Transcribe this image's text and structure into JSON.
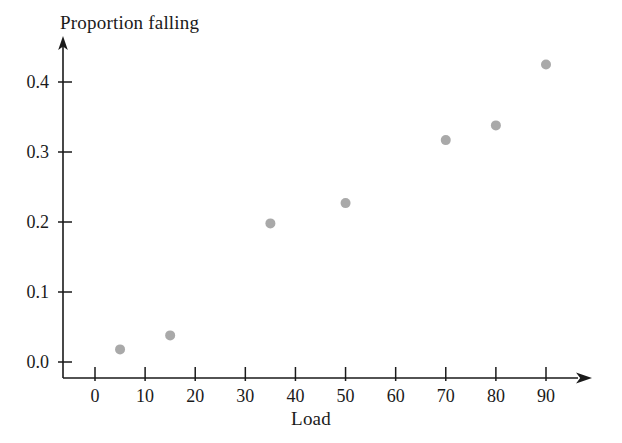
{
  "chart_data": {
    "type": "scatter",
    "title": "",
    "xlabel": "Load",
    "ylabel": "Proportion falling",
    "xlim": [
      0,
      95
    ],
    "ylim": [
      0.0,
      0.44
    ],
    "grid": false,
    "legend": "none",
    "x_ticks": [
      {
        "value": 0,
        "label": "0"
      },
      {
        "value": 10,
        "label": "10"
      },
      {
        "value": 20,
        "label": "20"
      },
      {
        "value": 30,
        "label": "30"
      },
      {
        "value": 40,
        "label": "40"
      },
      {
        "value": 50,
        "label": "50"
      },
      {
        "value": 60,
        "label": "60"
      },
      {
        "value": 70,
        "label": "70"
      },
      {
        "value": 80,
        "label": "80"
      },
      {
        "value": 90,
        "label": "90"
      }
    ],
    "y_ticks": [
      {
        "value": 0.0,
        "label": "0.0"
      },
      {
        "value": 0.1,
        "label": "0.1"
      },
      {
        "value": 0.2,
        "label": "0.2"
      },
      {
        "value": 0.3,
        "label": "0.3"
      },
      {
        "value": 0.4,
        "label": "0.4"
      }
    ],
    "x": [
      5,
      15,
      35,
      50,
      70,
      80,
      90
    ],
    "y": [
      0.018,
      0.038,
      0.198,
      0.227,
      0.317,
      0.338,
      0.425
    ],
    "points": [
      {
        "x": 5,
        "y": 0.018
      },
      {
        "x": 15,
        "y": 0.038
      },
      {
        "x": 35,
        "y": 0.198
      },
      {
        "x": 50,
        "y": 0.227
      },
      {
        "x": 70,
        "y": 0.317
      },
      {
        "x": 80,
        "y": 0.338
      },
      {
        "x": 90,
        "y": 0.425
      }
    ],
    "marker": {
      "shape": "circle",
      "radius": 5,
      "color": "#a9a9a9"
    },
    "axis_color": "#1a1a1a",
    "background_color": "#ffffff"
  }
}
